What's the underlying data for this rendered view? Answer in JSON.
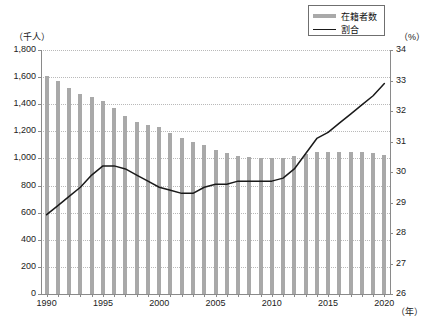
{
  "legend": {
    "position": "top-right",
    "entries": [
      {
        "label": "在籍者数",
        "marker": "bar",
        "color": "#a9a9a9"
      },
      {
        "label": "割合",
        "marker": "line",
        "color": "#1a1a1a"
      }
    ]
  },
  "axis_units": {
    "left": "（千人）",
    "right": "（%）",
    "x": "（年）"
  },
  "chart_data": {
    "type": "bar",
    "title": "",
    "xlabel": "（年）",
    "ylabel": "（千人）",
    "y2label": "（%）",
    "grid": true,
    "ylim": [
      0,
      1800
    ],
    "y2lim": [
      26,
      34
    ],
    "xlim": [
      1990,
      2020
    ],
    "yticks": [
      "0",
      "200",
      "400",
      "600",
      "800",
      "1,000",
      "1,200",
      "1,400",
      "1,600",
      "1,800"
    ],
    "y2ticks": [
      "26",
      "27",
      "28",
      "29",
      "30",
      "31",
      "32",
      "33",
      "34"
    ],
    "xticks": [
      "1990",
      "1995",
      "2000",
      "2005",
      "2010",
      "2015",
      "2020"
    ],
    "categories": [
      "1990",
      "1991",
      "1992",
      "1993",
      "1994",
      "1995",
      "1996",
      "1997",
      "1998",
      "1999",
      "2000",
      "2001",
      "2002",
      "2003",
      "2004",
      "2005",
      "2006",
      "2007",
      "2008",
      "2009",
      "2010",
      "2011",
      "2012",
      "2013",
      "2014",
      "2015",
      "2016",
      "2017",
      "2018",
      "2019",
      "2020"
    ],
    "series": [
      {
        "name": "在籍者数",
        "type": "bar",
        "axis": "left",
        "unit": "千人",
        "color": "#a9a9a9",
        "values": [
          1608,
          1572,
          1522,
          1478,
          1455,
          1425,
          1372,
          1310,
          1270,
          1248,
          1232,
          1190,
          1148,
          1118,
          1098,
          1065,
          1040,
          1015,
          1008,
          1005,
          1005,
          1002,
          1018,
          1030,
          1045,
          1048,
          1048,
          1045,
          1045,
          1038,
          1022
        ]
      },
      {
        "name": "割合",
        "type": "line",
        "axis": "right",
        "unit": "%",
        "color": "#1a1a1a",
        "values": [
          28.6,
          28.9,
          29.2,
          29.5,
          29.9,
          30.2,
          30.2,
          30.1,
          29.9,
          29.7,
          29.5,
          29.4,
          29.3,
          29.3,
          29.5,
          29.6,
          29.6,
          29.7,
          29.7,
          29.7,
          29.7,
          29.8,
          30.1,
          30.6,
          31.1,
          31.3,
          31.6,
          31.9,
          32.2,
          32.5,
          32.9
        ]
      }
    ]
  }
}
